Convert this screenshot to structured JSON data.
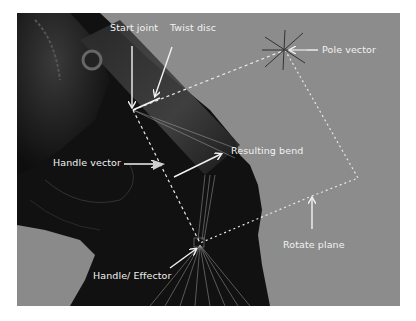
{
  "figure": {
    "background_color": "#8c8c8c",
    "annotation_color": "#f2f2f2"
  },
  "labels": {
    "start_joint": "Start joint",
    "twist_disc": "Twist disc",
    "pole_vector": "Pole vector",
    "handle_vector": "Handle vector",
    "resulting_bend": "Resulting bend",
    "rotate_plane": "Rotate plane",
    "handle_effector": "Handle/ Effector"
  },
  "icons": {
    "pole_vector_marker": "star-cross-icon",
    "arrows": "arrow-icon"
  }
}
